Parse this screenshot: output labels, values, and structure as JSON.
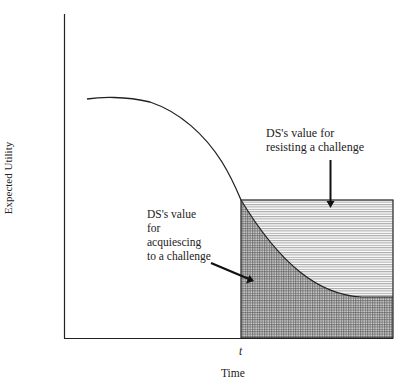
{
  "figure": {
    "y_axis_label": "Expected Utility",
    "x_axis_label": "Time",
    "x_tick_label": "t",
    "annotations": {
      "resisting": {
        "line1": "DS's value for",
        "line2": "resisting a challenge"
      },
      "acquiescing": {
        "line1": "DS's value",
        "line2": "for",
        "line3": "acquiescing",
        "line4": "to a challenge"
      }
    },
    "regions": [
      {
        "name": "resisting-region",
        "pattern": "horizontal-lines"
      },
      {
        "name": "acquiescing-region",
        "pattern": "grid-crosshatch"
      }
    ]
  }
}
